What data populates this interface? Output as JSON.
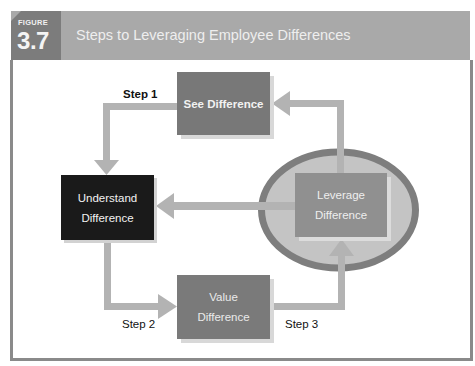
{
  "figure": {
    "label": "FIGURE",
    "number": "3.7",
    "title": "Steps to Leveraging Employee Differences"
  },
  "nodes": {
    "see": "See Difference",
    "understand_line1": "Understand",
    "understand_line2": "Difference",
    "value_line1": "Value",
    "value_line2": "Difference",
    "leverage_line1": "Leverage",
    "leverage_line2": "Difference"
  },
  "steps": {
    "step1": "Step 1",
    "step2": "Step 2",
    "step3": "Step 3"
  },
  "colors": {
    "header": "#a9a9a9",
    "badge": "#7c7c7c",
    "arrow": "#b3b3b3",
    "ellipse_ring": "#7e7e7e",
    "ellipse_fill": "#c4c4c4",
    "dark_box": "#1a1a1a",
    "mid_box": "#787878"
  }
}
